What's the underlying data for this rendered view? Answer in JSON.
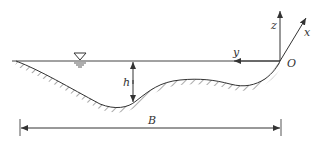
{
  "diagram": {
    "labels": {
      "z_axis": "z",
      "x_axis": "x",
      "y_axis": "y",
      "origin": "O",
      "depth": "h",
      "width": "B"
    },
    "symbols": {
      "water_surface": "free-surface-triangle"
    },
    "colors": {
      "line": "#333333",
      "background": "#ffffff"
    }
  }
}
